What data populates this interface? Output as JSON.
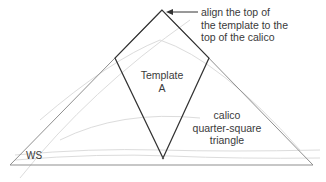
{
  "diagram": {
    "callout": {
      "line1": "align the top of",
      "line2": "the template to the",
      "line3": "top of the calico"
    },
    "template": {
      "line1": "Template",
      "line2": "A"
    },
    "calico": {
      "line1": "calico",
      "line2": "quarter-square",
      "line3": "triangle"
    },
    "ws_label": "WS",
    "colors": {
      "outline": "#3a3a3a",
      "triangle_edge": "#8a8a8a",
      "fabric_texture": "#d8d8d8",
      "background": "#ffffff"
    }
  }
}
